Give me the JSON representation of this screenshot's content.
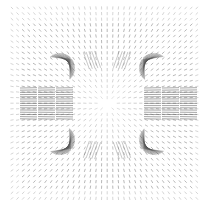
{
  "chart_data": {
    "type": "quiver",
    "title": "",
    "xlabel": "",
    "ylabel": "",
    "grid": false,
    "legend": null,
    "axes_visible": false,
    "canvas": {
      "width": 214,
      "height": 208,
      "background": "#ffffff"
    },
    "field": {
      "center": [
        107,
        104
      ],
      "grid_spacing": 5.6,
      "x_range": [
        12,
        202
      ],
      "y_range": [
        8,
        200
      ],
      "pattern": "radial outward, fading near center and corners",
      "arrow_color": "#555555",
      "base_length": 3.2,
      "dense_regions": [
        {
          "name": "upper-left-fan",
          "center": [
            60,
            68
          ],
          "angle_deg": -40,
          "radius_inner": 10,
          "radius_outer": 38,
          "length": 22
        },
        {
          "name": "upper-right-fan",
          "center": [
            154,
            68
          ],
          "angle_deg": -140,
          "radius_inner": 10,
          "radius_outer": 38,
          "length": 22
        },
        {
          "name": "lower-left-fan",
          "center": [
            60,
            140
          ],
          "angle_deg": 40,
          "radius_inner": 10,
          "radius_outer": 38,
          "length": 22
        },
        {
          "name": "lower-right-fan",
          "center": [
            154,
            140
          ],
          "angle_deg": 140,
          "radius_inner": 10,
          "radius_outer": 38,
          "length": 22
        },
        {
          "name": "left-band",
          "y_range": [
            88,
            120
          ],
          "x_range": [
            20,
            70
          ],
          "orientation": "horizontal",
          "length": 20
        },
        {
          "name": "right-band",
          "y_range": [
            88,
            120
          ],
          "x_range": [
            144,
            194
          ],
          "orientation": "horizontal",
          "length": 20
        },
        {
          "name": "upper-left-streaks",
          "center": [
            92,
            60
          ],
          "orientation_deg": 70,
          "length": 18
        },
        {
          "name": "upper-right-streaks",
          "center": [
            122,
            60
          ],
          "orientation_deg": 110,
          "length": 18
        },
        {
          "name": "lower-left-streaks",
          "center": [
            92,
            150
          ],
          "orientation_deg": -70,
          "length": 18
        },
        {
          "name": "lower-right-streaks",
          "center": [
            122,
            150
          ],
          "orientation_deg": -110,
          "length": 18
        }
      ]
    }
  }
}
